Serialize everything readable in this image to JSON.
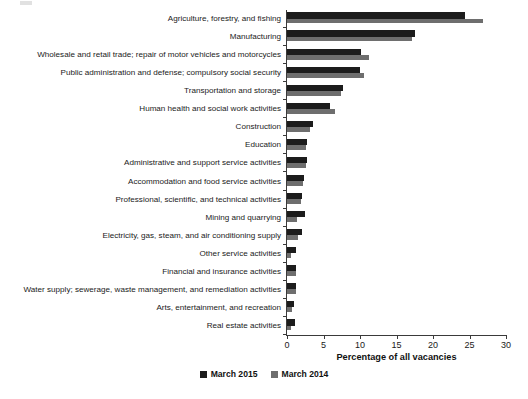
{
  "chart_data": {
    "type": "bar",
    "orientation": "horizontal",
    "title": "",
    "xlabel": "Percentage of all vacancies",
    "ylabel": "",
    "xlim": [
      0,
      30
    ],
    "xticks": [
      0,
      5,
      10,
      15,
      20,
      25,
      30
    ],
    "grid": false,
    "legend_position": "bottom-center",
    "categories": [
      "Agriculture, forestry, and fishing",
      "Manufacturing",
      "Wholesale and retail trade; repair of motor vehicles and motorcycles",
      "Public administration and defense; compulsory social security",
      "Transportation and storage",
      "Human health and social work activities",
      "Construction",
      "Education",
      "Administrative and support service activities",
      "Accommodation and food service activities",
      "Professional, scientific, and technical activities",
      "Mining and quarrying",
      "Electricity, gas, steam, and air conditioning supply",
      "Other service activities",
      "Financial and insurance activities",
      "Water supply; sewerage, waste management, and remediation activities",
      "Arts, entertainment, and recreation",
      "Real estate activities"
    ],
    "series": [
      {
        "name": "March 2015",
        "color": "#1c1c1c",
        "values": [
          24.4,
          17.5,
          10.1,
          10.0,
          7.7,
          5.9,
          3.6,
          2.7,
          2.8,
          2.3,
          2.0,
          2.5,
          2.0,
          1.3,
          1.3,
          1.2,
          1.0,
          1.1
        ]
      },
      {
        "name": "March 2014",
        "color": "#6e6e6e",
        "values": [
          26.8,
          17.1,
          11.2,
          10.6,
          7.4,
          6.6,
          3.2,
          2.6,
          2.6,
          2.2,
          1.9,
          1.4,
          1.5,
          0.6,
          1.3,
          1.2,
          0.7,
          0.6
        ]
      }
    ]
  },
  "legend": {
    "items": [
      {
        "label": "March 2015",
        "color": "#1c1c1c"
      },
      {
        "label": "March 2014",
        "color": "#6e6e6e"
      }
    ]
  }
}
